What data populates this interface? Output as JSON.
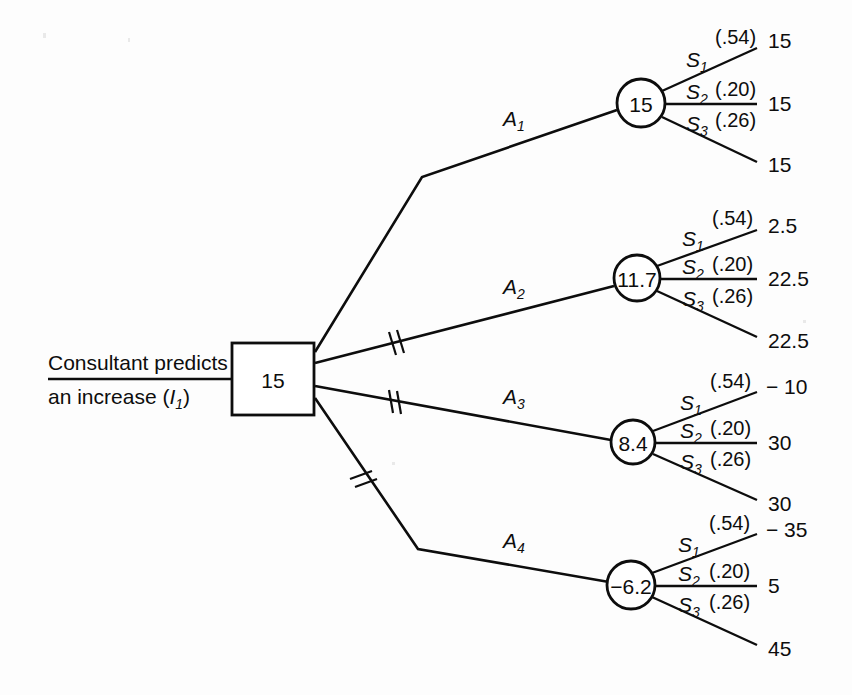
{
  "diagram": {
    "type": "decision-tree",
    "ink_color": "#0d0d0d",
    "background_color": "#fdfdfd"
  },
  "caption": {
    "line1": "Consultant predicts",
    "line2_prefix": "an increase (",
    "line2_symbol": "I",
    "line2_subscript": "1",
    "line2_suffix": ")"
  },
  "decision_node": {
    "name": "decision-square",
    "value": "15",
    "shape": "square"
  },
  "branches": [
    {
      "id": "A1",
      "action_label": "A",
      "action_subscript": "1",
      "pruned": false,
      "node": {
        "value": "15",
        "shape": "circle"
      },
      "outcomes": [
        {
          "state": "S",
          "state_subscript": "1",
          "probability": "(.54)",
          "payoff": "15"
        },
        {
          "state": "S",
          "state_subscript": "2",
          "probability": "(.20)",
          "payoff": "15"
        },
        {
          "state": "S",
          "state_subscript": "3",
          "probability": "(.26)",
          "payoff": "15"
        }
      ]
    },
    {
      "id": "A2",
      "action_label": "A",
      "action_subscript": "2",
      "pruned": true,
      "node": {
        "value": "11.7",
        "shape": "circle"
      },
      "outcomes": [
        {
          "state": "S",
          "state_subscript": "1",
          "probability": "(.54)",
          "payoff": "2.5"
        },
        {
          "state": "S",
          "state_subscript": "2",
          "probability": "(.20)",
          "payoff": "22.5"
        },
        {
          "state": "S",
          "state_subscript": "3",
          "probability": "(.26)",
          "payoff": "22.5"
        }
      ]
    },
    {
      "id": "A3",
      "action_label": "A",
      "action_subscript": "3",
      "pruned": true,
      "node": {
        "value": "8.4",
        "shape": "circle"
      },
      "outcomes": [
        {
          "state": "S",
          "state_subscript": "1",
          "probability": "(.54)",
          "payoff": "− 10"
        },
        {
          "state": "S",
          "state_subscript": "2",
          "probability": "(.20)",
          "payoff": "30"
        },
        {
          "state": "S",
          "state_subscript": "3",
          "probability": "(.26)",
          "payoff": "30"
        }
      ]
    },
    {
      "id": "A4",
      "action_label": "A",
      "action_subscript": "4",
      "pruned": true,
      "node": {
        "value": "−6.2",
        "shape": "circle"
      },
      "outcomes": [
        {
          "state": "S",
          "state_subscript": "1",
          "probability": "(.54)",
          "payoff": "− 35"
        },
        {
          "state": "S",
          "state_subscript": "2",
          "probability": "(.20)",
          "payoff": "5"
        },
        {
          "state": "S",
          "state_subscript": "3",
          "probability": "(.26)",
          "payoff": "45"
        }
      ]
    }
  ]
}
